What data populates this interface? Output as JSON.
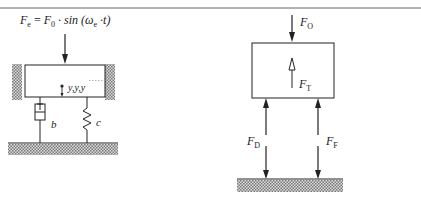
{
  "diagram": {
    "left": {
      "excitation_force": {
        "lhs": "F",
        "lhs_sub": "e",
        "eq": " = ",
        "rhs": "F",
        "rhs_sub": "0",
        "func": " · sin (",
        "omega": "ω",
        "omega_sub": "e",
        "tail": " ·t)"
      },
      "displacement_label": "y,y,y",
      "damper_label": "b",
      "spring_label": "c"
    },
    "right": {
      "top_force": {
        "name": "F",
        "sub": "O"
      },
      "inertia_force": {
        "name": "F",
        "sub": "T"
      },
      "damper_force": {
        "name": "F",
        "sub": "D"
      },
      "spring_force": {
        "name": "F",
        "sub": "F"
      }
    }
  },
  "colors": {
    "line": "#222222",
    "hatch": "#888888",
    "rule": "#666666"
  }
}
